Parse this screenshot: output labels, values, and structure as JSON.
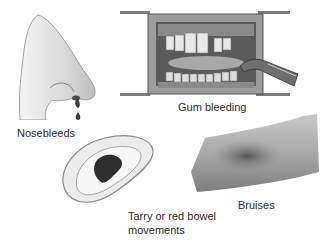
{
  "figure": {
    "panels": [
      {
        "id": "nose",
        "label": "Nosebleeds",
        "icon": "nose-bleeding-illustration"
      },
      {
        "id": "gums",
        "label": "Gum bleeding",
        "icon": "mouth-gum-bleeding-illustration"
      },
      {
        "id": "bowel",
        "label_lines": [
          "Tarry or red bowel",
          "movements"
        ],
        "icon": "bedpan-stool-illustration"
      },
      {
        "id": "bruise",
        "label": "Bruises",
        "icon": "arm-bruise-illustration"
      }
    ],
    "colors": {
      "ink": "#2a2a2a",
      "skin_light": "#e6e6e6",
      "skin_mid": "#bdbdbd",
      "dark": "#2e2e2e",
      "background": "#ffffff"
    }
  }
}
